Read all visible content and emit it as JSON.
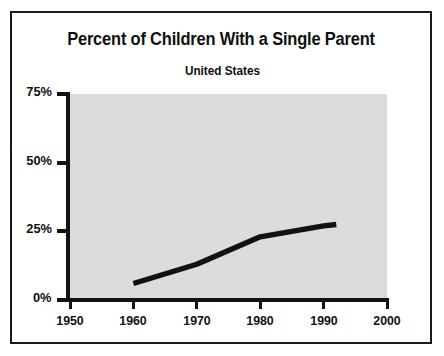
{
  "figure": {
    "border_color": "#1a1a1a",
    "plot_background": "#dcdcdc",
    "axis_color": "#121212",
    "series_color": "#121212"
  },
  "chart_data": {
    "type": "line",
    "title": "Percent of Children With a Single Parent",
    "subtitle": "United States",
    "xlabel": "",
    "ylabel": "",
    "xlim": [
      1950,
      2000
    ],
    "ylim": [
      0,
      75
    ],
    "grid": false,
    "legend": "none",
    "x_ticks": [
      1950,
      1960,
      1970,
      1980,
      1990,
      2000
    ],
    "x_tick_labels": [
      "1950",
      "1960",
      "1970",
      "1980",
      "1990",
      "2000"
    ],
    "y_ticks": [
      0,
      25,
      50,
      75
    ],
    "y_tick_labels": [
      "0%",
      "25%",
      "50%",
      "75%"
    ],
    "series": [
      {
        "name": "Percent of children with a single parent",
        "x": [
          1960,
          1970,
          1980,
          1990,
          1992
        ],
        "values": [
          6,
          13,
          23,
          27,
          27.5
        ]
      }
    ]
  }
}
